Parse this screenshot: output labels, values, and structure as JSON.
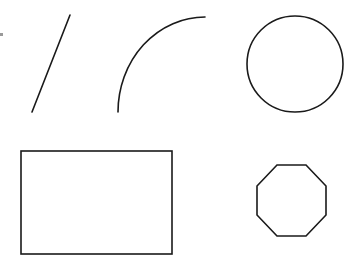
{
  "canvas": {
    "width": 358,
    "height": 270,
    "background": "#ffffff",
    "stroke_color": "#1a1a1a"
  },
  "shapes": [
    {
      "type": "line",
      "name": "line",
      "x1": 32,
      "y1": 112,
      "x2": 70,
      "y2": 15
    },
    {
      "type": "arc",
      "name": "arc",
      "start": [
        118,
        112
      ],
      "end": [
        205,
        17
      ],
      "rx": 87,
      "ry": 95
    },
    {
      "type": "circle",
      "name": "circle",
      "cx": 295,
      "cy": 64,
      "r": 48
    },
    {
      "type": "rectangle",
      "name": "rectangle",
      "x": 21,
      "y": 151,
      "width": 151,
      "height": 103
    },
    {
      "type": "octagon",
      "name": "octagon",
      "points": "277,165 306,165 326,186 326,215 306,236 277,236 257,215 257,186"
    }
  ]
}
